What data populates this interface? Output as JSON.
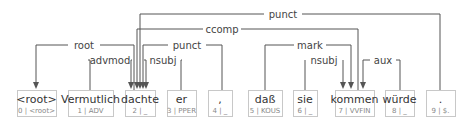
{
  "tokens": [
    {
      "index": "0",
      "word": "<root>",
      "tag": "<root>"
    },
    {
      "index": "1",
      "word": "Vermutlich",
      "tag": "ADV"
    },
    {
      "index": "2",
      "word": "dachte",
      "tag": "_"
    },
    {
      "index": "3",
      "word": "er",
      "tag": "PPER"
    },
    {
      "index": "4",
      "word": ",",
      "tag": "_"
    },
    {
      "index": "5",
      "word": "daß",
      "tag": "KOUS"
    },
    {
      "index": "6",
      "word": "sie",
      "tag": "_"
    },
    {
      "index": "7",
      "word": "kommen",
      "tag": "VVFIN"
    },
    {
      "index": "8",
      "word": "würde",
      "tag": "_"
    },
    {
      "index": "9",
      "word": ".",
      "tag": "$."
    }
  ],
  "arcs": [
    {
      "label": "punct",
      "head": 2,
      "dep": 9
    },
    {
      "label": "ccomp",
      "head": 2,
      "dep": 7
    },
    {
      "label": "root",
      "head": 0,
      "dep": 2
    },
    {
      "label": "punct",
      "head": 2,
      "dep": 4
    },
    {
      "label": "mark",
      "head": 7,
      "dep": 5
    },
    {
      "label": "advmod",
      "head": 2,
      "dep": 1
    },
    {
      "label": "nsubj",
      "head": 2,
      "dep": 3
    },
    {
      "label": "nsubj",
      "head": 7,
      "dep": 6
    },
    {
      "label": "aux",
      "head": 7,
      "dep": 8
    }
  ],
  "colors": {
    "edge": "#555555",
    "box_border": "#c8c8c8",
    "word": "#333333",
    "meta": "#888888"
  }
}
